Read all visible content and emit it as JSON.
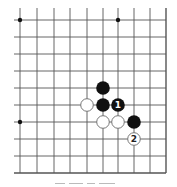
{
  "diagram": {
    "type": "go-board-fragment",
    "columns": 10,
    "rows": 10,
    "x_lines": [
      20,
      37,
      54,
      70,
      87,
      103,
      118,
      134,
      150,
      166
    ],
    "y_lines": [
      20,
      37,
      54,
      71,
      88,
      105,
      122,
      139,
      156,
      173
    ],
    "edges": {
      "left_open": true,
      "top_open": true,
      "right_closed": true,
      "bottom_closed": true
    },
    "star_points": [
      {
        "col": 0,
        "row": 0
      },
      {
        "col": 6,
        "row": 0
      },
      {
        "col": 0,
        "row": 6
      }
    ],
    "stones": [
      {
        "color": "black",
        "col": 5,
        "row": 4,
        "label": ""
      },
      {
        "color": "white",
        "col": 4,
        "row": 5,
        "label": ""
      },
      {
        "color": "black",
        "col": 5,
        "row": 5,
        "label": ""
      },
      {
        "color": "black",
        "col": 6,
        "row": 5,
        "label": "1"
      },
      {
        "color": "white",
        "col": 5,
        "row": 6,
        "label": ""
      },
      {
        "color": "white",
        "col": 6,
        "row": 6,
        "label": ""
      },
      {
        "color": "black",
        "col": 7,
        "row": 6,
        "label": ""
      },
      {
        "color": "white",
        "col": 7,
        "row": 7,
        "label": "2"
      }
    ],
    "colors": {
      "line": "#555555",
      "black_stone": "#111111",
      "white_stone_fill": "#ffffff",
      "white_stone_stroke": "#777777",
      "star": "#111111"
    }
  }
}
